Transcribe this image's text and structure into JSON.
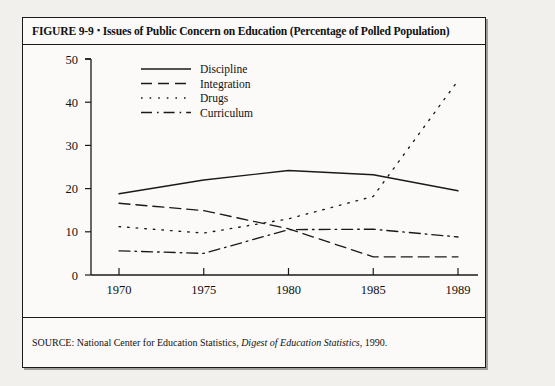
{
  "figure": {
    "label": "FIGURE 9-9",
    "separator": "▪",
    "title": "Issues of Public Concern on Education (Percentage of Polled Population)",
    "source_prefix": "SOURCE: National Center for Education Statistics, ",
    "source_italic": "Digest of Education Statistics",
    "source_suffix": ", 1990."
  },
  "chart_data": {
    "type": "line",
    "title": "Issues of Public Concern on Education (Percentage of Polled Population)",
    "xlabel": "",
    "ylabel": "",
    "x": [
      1970,
      1975,
      1980,
      1985,
      1989
    ],
    "categories": [
      "1970",
      "1975",
      "1980",
      "1985",
      "1989"
    ],
    "xtick_labels": [
      "1970",
      "1975",
      "1980",
      "1985",
      "1989"
    ],
    "ytick_labels": [
      "0",
      "10",
      "20",
      "30",
      "40",
      "50"
    ],
    "yticks": [
      0,
      10,
      20,
      30,
      40,
      50
    ],
    "ylim": [
      0,
      50
    ],
    "xlim": [
      1970,
      1989
    ],
    "grid": false,
    "legend_position": "upper-left-inside",
    "series": [
      {
        "name": "Discipline",
        "style": "solid",
        "values": [
          18.8,
          22.0,
          24.2,
          23.2,
          19.5
        ]
      },
      {
        "name": "Integration",
        "style": "dashed",
        "values": [
          16.6,
          14.9,
          10.7,
          4.2,
          4.2
        ]
      },
      {
        "name": "Drugs",
        "style": "dotted",
        "values": [
          11.2,
          9.7,
          13.0,
          18.2,
          45.0
        ]
      },
      {
        "name": "Curriculum",
        "style": "dash-dot",
        "values": [
          5.6,
          5.0,
          10.5,
          10.6,
          8.8
        ]
      }
    ]
  },
  "colors": {
    "ink": "#1a1a1a",
    "paper": "#fbfaf8",
    "page": "#f2f0ec"
  }
}
